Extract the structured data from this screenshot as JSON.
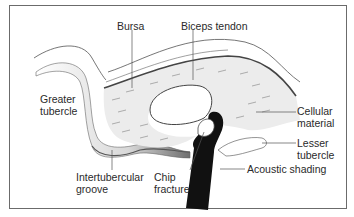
{
  "diagram": {
    "labels": {
      "bursa": "Bursa",
      "biceps_tendon": "Biceps tendon",
      "greater_tubercle_1": "Greater",
      "greater_tubercle_2": "tubercle",
      "cellular_material_1": "Cellular",
      "cellular_material_2": "material",
      "lesser_tubercle_1": "Lesser",
      "lesser_tubercle_2": "tubercle",
      "acoustic_shading": "Acoustic shading",
      "intertubercular_groove_1": "Intertubercular",
      "intertubercular_groove_2": "groove",
      "chip_fracture_1": "Chip",
      "chip_fracture_2": "fracture"
    },
    "colors": {
      "line": "#555555",
      "fluid_fill": "#ececec",
      "shadow": "#111111",
      "bone_shade": "#9a9a9a"
    }
  }
}
